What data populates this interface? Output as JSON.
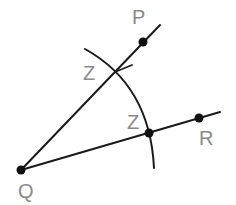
{
  "diagram": {
    "type": "geometric-construction",
    "colors": {
      "stroke": "#1a1a1a",
      "label": "#8a8a8a",
      "background": "#ffffff"
    },
    "points": [
      {
        "id": "Q",
        "label": "Q",
        "x": 21,
        "y": 170,
        "label_x": 18,
        "label_y": 198
      },
      {
        "id": "P",
        "label": "P",
        "x": 143,
        "y": 42,
        "label_x": 132,
        "label_y": 24
      },
      {
        "id": "W",
        "label": "W",
        "x": 115,
        "y": 72,
        "label_x": 83,
        "label_y": 80
      },
      {
        "id": "Z",
        "label": "Z",
        "x": 149,
        "y": 133,
        "label_x": 127,
        "label_y": 129
      },
      {
        "id": "R",
        "label": "R",
        "x": 199,
        "y": 118,
        "label_x": 199,
        "label_y": 145
      }
    ],
    "rays": [
      {
        "from": "Q",
        "through": "P",
        "end_x": 160,
        "end_y": 25
      },
      {
        "from": "Q",
        "through": "R",
        "end_x": 220,
        "end_y": 112
      }
    ],
    "arc": {
      "center": "Q",
      "start_x": 85,
      "start_y": 49,
      "end_x": 154,
      "end_y": 168
    },
    "tick": {
      "x1": 115,
      "y1": 72,
      "x2": 132,
      "y2": 65
    }
  }
}
